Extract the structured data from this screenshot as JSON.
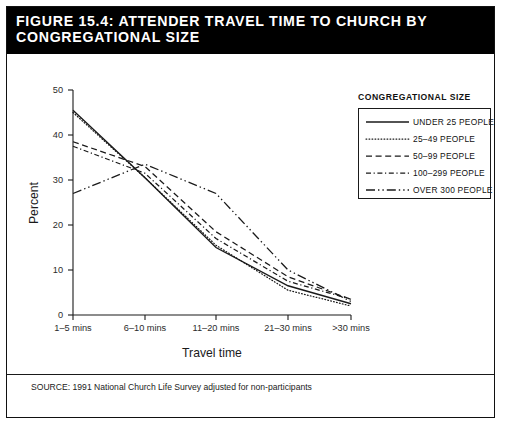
{
  "figure": {
    "title": "FIGURE 15.4: ATTENDER TRAVEL TIME TO CHURCH BY CONGREGATIONAL SIZE",
    "source": "SOURCE: 1991 National Church Life Survey adjusted for non-participants"
  },
  "legend": {
    "heading": "CONGREGATIONAL SIZE",
    "entries": [
      {
        "label": "UNDER 25 PEOPLE",
        "style": "solid"
      },
      {
        "label": "25–49 PEOPLE",
        "style": "dotted"
      },
      {
        "label": "50–99 PEOPLE",
        "style": "dashed"
      },
      {
        "label": "100–299 PEOPLE",
        "style": "dash-dot-short"
      },
      {
        "label": "OVER 300 PEOPLE",
        "style": "long-dash-dot"
      }
    ]
  },
  "axes": {
    "y_label": "Percent",
    "y_ticks": [
      "0",
      "10",
      "20",
      "30",
      "40",
      "50"
    ],
    "x_label": "Travel time",
    "x_ticks": [
      "1–5 mins",
      "6–10 mins",
      "11–20 mins",
      "21–30 mins",
      ">30 mins"
    ]
  },
  "chart_data": {
    "type": "line",
    "title": "FIGURE 15.4: ATTENDER TRAVEL TIME TO CHURCH BY CONGREGATIONAL SIZE",
    "xlabel": "Travel time",
    "ylabel": "Percent",
    "ylim": [
      0,
      50
    ],
    "grid": false,
    "legend_position": "right-top",
    "legend_title": "CONGREGATIONAL SIZE",
    "categories": [
      "1–5 mins",
      "6–10 mins",
      "11–20 mins",
      "21–30 mins",
      ">30 mins"
    ],
    "series": [
      {
        "name": "UNDER 25 PEOPLE",
        "style": "solid",
        "values": [
          45.5,
          30.5,
          15.0,
          6.5,
          2.5
        ]
      },
      {
        "name": "25–49 PEOPLE",
        "style": "dotted",
        "values": [
          45.0,
          30.5,
          15.5,
          5.5,
          2.0
        ]
      },
      {
        "name": "50–99 PEOPLE",
        "style": "dashed",
        "values": [
          38.5,
          33.0,
          18.5,
          8.5,
          3.5
        ]
      },
      {
        "name": "100–299 PEOPLE",
        "style": "dash-dot-short",
        "values": [
          37.5,
          31.5,
          17.0,
          7.5,
          3.5
        ]
      },
      {
        "name": "OVER 300 PEOPLE",
        "style": "long-dash-dot",
        "values": [
          27.0,
          33.5,
          27.0,
          10.0,
          3.0
        ]
      }
    ],
    "annotations": [
      "SOURCE: 1991 National Church Life Survey adjusted for non-participants"
    ]
  }
}
